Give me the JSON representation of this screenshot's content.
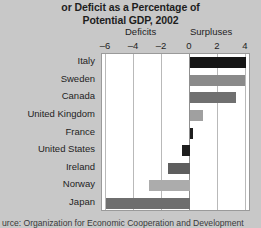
{
  "chart_data": {
    "type": "bar",
    "orientation": "horizontal",
    "title": "or Deficit as a Percentage of Potential GDP, 2002",
    "title_line1": "or Deficit as a Percentage of",
    "title_line2": "Potential GDP, 2002",
    "xlabel": "",
    "ylabel": "",
    "xlim": [
      -7,
      4.5
    ],
    "xticks": [
      -6,
      -4,
      -2,
      0,
      2,
      4
    ],
    "xticklabels": [
      "–6",
      "–4",
      "–2",
      "0",
      "2",
      "4"
    ],
    "grid": true,
    "grid_axis": "x",
    "legend": "none",
    "annotations": [
      "Deficits",
      "Surpluses"
    ],
    "axis_side_labels": {
      "left": "Deficits",
      "right": "Surpluses"
    },
    "categories": [
      "Italy",
      "Sweden",
      "Canada",
      "United Kingdom",
      "France",
      "United States",
      "Ireland",
      "Norway",
      "Japan"
    ],
    "values": [
      4.0,
      3.9,
      3.3,
      0.9,
      0.2,
      -0.6,
      -1.6,
      -2.9,
      -6.0
    ],
    "bar_colors": [
      "#161616",
      "#8a8a8a",
      "#707070",
      "#a0a0a0",
      "#1e1e1e",
      "#1e1e1e",
      "#5e5e5e",
      "#acacac",
      "#6e6e6e"
    ],
    "source": "urce: Organization for Economic Cooperation and Development"
  },
  "footer": {
    "source_text": "urce: Organization for Economic Cooperation and Development"
  }
}
